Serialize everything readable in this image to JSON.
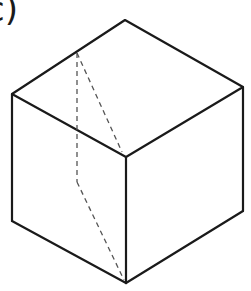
{
  "figure": {
    "label": "c)",
    "stroke_color": "#1a1a1a",
    "dashed_color": "#555555",
    "vertices": {
      "top": [
        125,
        20
      ],
      "left_top": [
        12,
        94
      ],
      "right_top": [
        243,
        87
      ],
      "front_top": [
        126,
        157
      ],
      "left_bottom": [
        12,
        221
      ],
      "right_bottom": [
        243,
        211
      ],
      "front_bottom": [
        126,
        283
      ]
    },
    "dashed_points": {
      "edge_point": [
        77,
        53
      ],
      "turn_point": [
        77,
        182
      ]
    }
  }
}
